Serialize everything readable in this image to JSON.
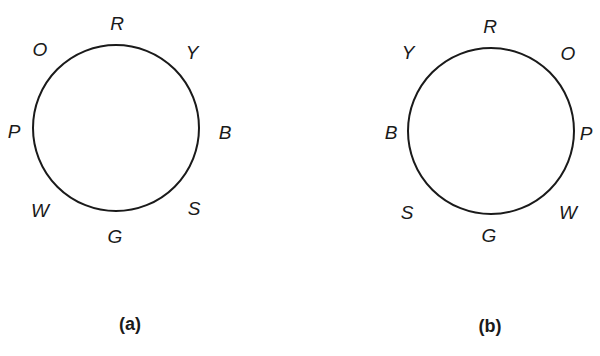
{
  "figures": [
    {
      "id": "a",
      "caption": "(a)",
      "circle": {
        "cx": 116,
        "cy": 128,
        "r": 84
      },
      "caption_pos": {
        "x": 130,
        "y": 324
      },
      "labels": [
        {
          "text": "R",
          "x": 117,
          "y": 23
        },
        {
          "text": "Y",
          "x": 192,
          "y": 52
        },
        {
          "text": "B",
          "x": 225,
          "y": 132
        },
        {
          "text": "S",
          "x": 194,
          "y": 208
        },
        {
          "text": "G",
          "x": 115,
          "y": 236
        },
        {
          "text": "W",
          "x": 40,
          "y": 210
        },
        {
          "text": "P",
          "x": 14,
          "y": 131
        },
        {
          "text": "O",
          "x": 40,
          "y": 49
        }
      ]
    },
    {
      "id": "b",
      "caption": "(b)",
      "circle": {
        "cx": 491,
        "cy": 131,
        "r": 84
      },
      "caption_pos": {
        "x": 490,
        "y": 326
      },
      "labels": [
        {
          "text": "R",
          "x": 490,
          "y": 26
        },
        {
          "text": "O",
          "x": 568,
          "y": 53
        },
        {
          "text": "P",
          "x": 586,
          "y": 133
        },
        {
          "text": "W",
          "x": 568,
          "y": 212
        },
        {
          "text": "G",
          "x": 489,
          "y": 235
        },
        {
          "text": "S",
          "x": 407,
          "y": 212
        },
        {
          "text": "B",
          "x": 391,
          "y": 132
        },
        {
          "text": "Y",
          "x": 408,
          "y": 52
        }
      ]
    }
  ],
  "colors": {
    "stroke": "#1a1a1a",
    "background": "#ffffff"
  }
}
